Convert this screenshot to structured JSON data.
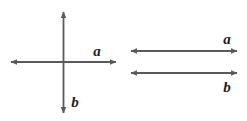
{
  "figure": {
    "background_color": "#ffffff",
    "line_color": "#5a5a5a",
    "label_color": "#1c1c1c",
    "line_width": 1.8,
    "panels": [
      {
        "id": "panel-perpendicular",
        "name": "perpendicular-vectors",
        "description": "Two double-headed arrows crossing at right angles",
        "arrows": [
          {
            "id": "arrow-a-horizontal",
            "label": "a",
            "orientation": "horizontal",
            "double_headed": true,
            "x1": 11,
            "y1": 62,
            "x2": 116,
            "y2": 62,
            "label_x": 97,
            "label_y": 56
          },
          {
            "id": "arrow-b-vertical",
            "label": "b",
            "orientation": "vertical",
            "double_headed": true,
            "x1": 63.5,
            "y1": 12,
            "x2": 63.5,
            "y2": 113,
            "label_x": 75,
            "label_y": 107
          }
        ]
      },
      {
        "id": "panel-parallel",
        "name": "parallel-vectors",
        "description": "Two double-headed arrows drawn parallel to each other",
        "arrows": [
          {
            "id": "arrow-a-parallel-top",
            "label": "a",
            "orientation": "horizontal",
            "double_headed": true,
            "x1": 131,
            "y1": 51,
            "x2": 237,
            "y2": 51,
            "label_x": 227,
            "label_y": 44
          },
          {
            "id": "arrow-b-parallel-bottom",
            "label": "b",
            "orientation": "horizontal",
            "double_headed": true,
            "x1": 131,
            "y1": 73,
            "x2": 237,
            "y2": 73,
            "label_x": 227,
            "label_y": 92
          }
        ]
      }
    ],
    "labels": {
      "a": "a",
      "b": "b"
    }
  }
}
